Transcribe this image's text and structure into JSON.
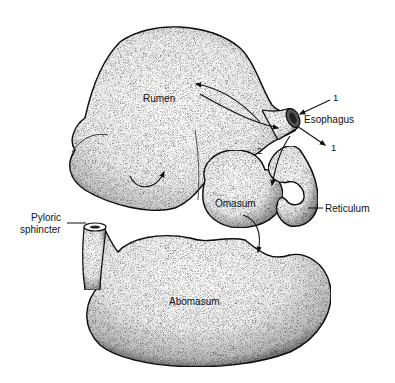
{
  "diagram": {
    "type": "anatomical-illustration",
    "colors": {
      "background": "#ffffff",
      "outline": "#111111",
      "stipple_dark": "#2a2a2a",
      "stipple_light": "#ffffff"
    },
    "labels": {
      "rumen": "Rumen",
      "esophagus": "Esophagus",
      "omasum": "Omasum",
      "reticulum": "Reticulum",
      "pyloric_line1": "Pyloric",
      "pyloric_line2": "sphincter",
      "abomasum": "Abomasum",
      "marker_1_top": "1",
      "marker_1_bottom": "1",
      "marker_2": "2",
      "signature": "S.K."
    }
  }
}
